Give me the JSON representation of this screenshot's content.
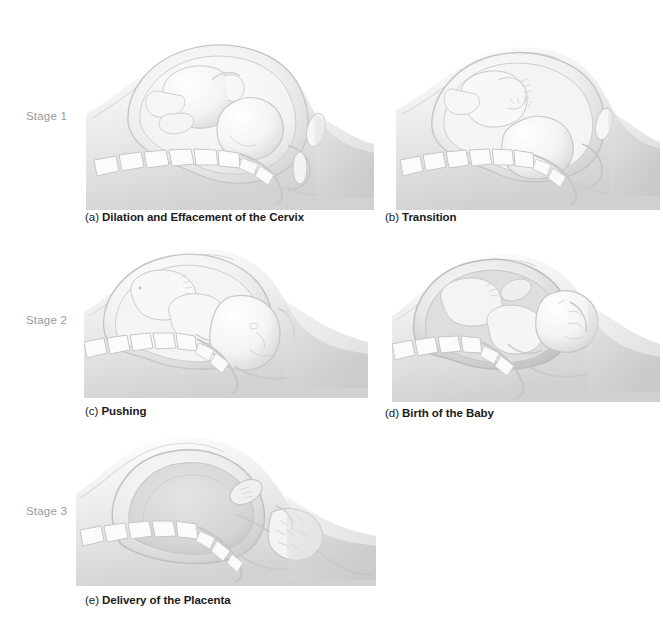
{
  "figure": {
    "background_color": "#ffffff",
    "stage_label_color": "#9a9a9a",
    "caption_color": "#1b1b1b",
    "illustration_style": "grayscale airbrush medical illustration, sagittal cross-section"
  },
  "stages": [
    {
      "id": "stage-1",
      "label": "Stage 1"
    },
    {
      "id": "stage-2",
      "label": "Stage 2"
    },
    {
      "id": "stage-3",
      "label": "Stage 3"
    }
  ],
  "panels": [
    {
      "id": "panel-a",
      "tag": "(a)",
      "caption": "Dilation and Effacement of the Cervix",
      "stage": "Stage 1",
      "depicts": "Fetus head-down high in uterus; cervix beginning to dilate and efface; maternal lumbar spine and sacrum at left and below"
    },
    {
      "id": "panel-b",
      "tag": "(b)",
      "caption": "Transition",
      "stage": "Stage 1",
      "depicts": "Fetus descended deeper into pelvis, head engaged at fully dilated cervix"
    },
    {
      "id": "panel-c",
      "tag": "(c)",
      "caption": "Pushing",
      "stage": "Stage 2",
      "depicts": "Fetal head crowning and passing through the birth canal"
    },
    {
      "id": "panel-d",
      "tag": "(d)",
      "caption": "Birth of the Baby",
      "stage": "Stage 2",
      "depicts": "Baby's head delivered outside the body, shoulders following"
    },
    {
      "id": "panel-e",
      "tag": "(e)",
      "caption": "Delivery of the Placenta",
      "stage": "Stage 3",
      "depicts": "Empty contracted uterus; placenta and umbilical cord being expelled through the birth canal"
    }
  ]
}
